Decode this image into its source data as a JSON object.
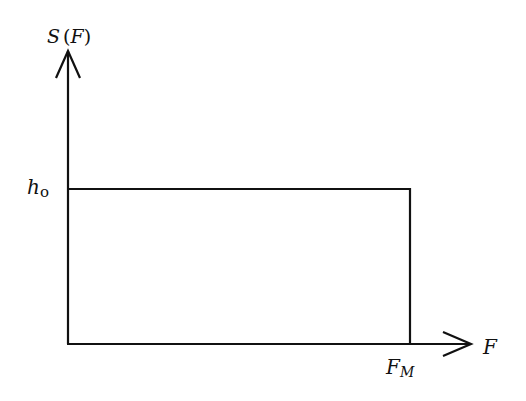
{
  "diagram": {
    "type": "step-function plot",
    "y_axis": {
      "label_main": "S",
      "label_open": "(",
      "label_arg": "F",
      "label_close": ")"
    },
    "x_axis": {
      "label": "F"
    },
    "level": {
      "label_main": "h",
      "label_sub": "o"
    },
    "cutoff": {
      "label_main": "F",
      "label_sub": "M"
    },
    "colors": {
      "stroke": "#111111",
      "background": "#ffffff"
    }
  }
}
